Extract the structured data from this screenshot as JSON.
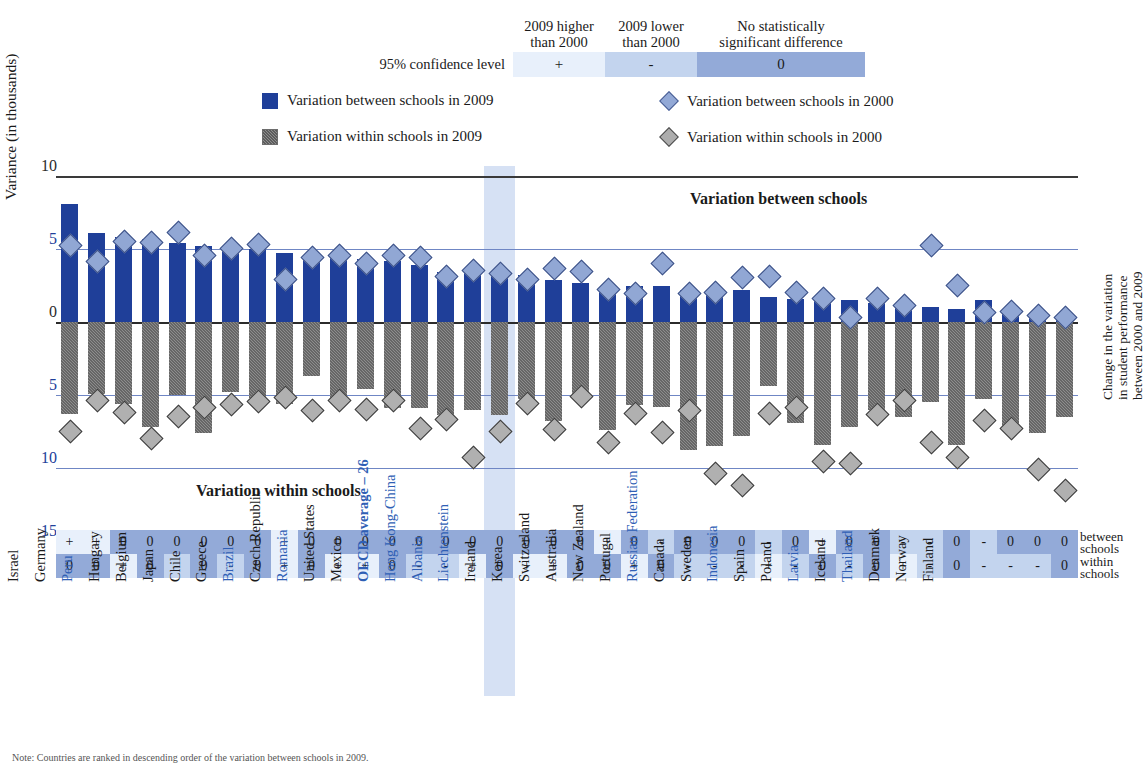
{
  "confidence": {
    "row_label": "95% confidence level",
    "headers": [
      "2009 higher\nthan 2000",
      "2009 lower\nthan 2000",
      "No statistically\nsignificant difference"
    ],
    "header_1_line1": "2009 higher",
    "header_1_line2": "than 2000",
    "header_2_line1": "2009 lower",
    "header_2_line2": "than 2000",
    "header_3_line1": "No statistically",
    "header_3_line2": "significant difference",
    "symbols": [
      "+",
      "-",
      "0"
    ],
    "colors": {
      "higher": "#e8f0fb",
      "lower": "#c3d4ee",
      "nosig": "#93aad8"
    }
  },
  "legend": [
    {
      "marker": "square-blue",
      "label": "Variation between schools in 2009"
    },
    {
      "marker": "diamond-blue",
      "label": "Variation between schools in 2000"
    },
    {
      "marker": "square-grey-hatched",
      "label": "Variation within schools in 2009"
    },
    {
      "marker": "diamond-grey",
      "label": "Variation within schools in 2000"
    }
  ],
  "axis": {
    "y_title": "Variance (in thousands)",
    "y_ticks": [
      "10",
      "5",
      "0",
      "5",
      "10",
      "15"
    ],
    "right_title_line1": "Change in the variation",
    "right_title_line2": "in student performance",
    "right_title_line3": "between 2000 and 2009"
  },
  "plot_labels": {
    "between": "Variation between schools",
    "within": "Variation within schools"
  },
  "sig_side_labels": {
    "between_l1": "between",
    "between_l2": "schools",
    "within_l1": "within",
    "within_l2": "schools"
  },
  "chart_data": {
    "type": "bar",
    "ylabel": "Variance (in thousands)",
    "ylim": [
      -15,
      10
    ],
    "grid": true,
    "zero_line": 0,
    "categories": [
      "Argentina",
      "Italy",
      "Bulgaria",
      "Israel",
      "Germany",
      "Peru",
      "Hungary",
      "Belgium",
      "Japan",
      "Chile",
      "Greece",
      "Brazil",
      "Czech Republic",
      "Romania",
      "United States",
      "Mexico",
      "OECD average – 26",
      "Hong Kong-China",
      "Albania",
      "Liechtenstein",
      "Ireland",
      "Korea",
      "Switzerland",
      "Australia",
      "New Zealand",
      "Portugal",
      "Russian Federation",
      "Canada",
      "Sweden",
      "Indonesia",
      "Spain",
      "Poland",
      "Latvia",
      "Iceland",
      "Thailand",
      "Denmark",
      "Norway",
      "Finland"
    ],
    "highlight_categories": [
      "Argentina",
      "Bulgaria",
      "Peru",
      "Brazil",
      "Romania",
      "OECD average – 26",
      "Hong Kong-China",
      "Albania",
      "Liechtenstein",
      "Russian Federation",
      "Indonesia",
      "Latvia",
      "Thailand"
    ],
    "oecd_index": 16,
    "series": [
      {
        "name": "Variation between schools in 2009",
        "kind": "bar-up",
        "values": [
          8.1,
          6.1,
          5.8,
          5.7,
          5.4,
          5.2,
          5.1,
          5.0,
          4.7,
          4.6,
          4.5,
          4.3,
          4.2,
          3.9,
          3.4,
          3.5,
          3.4,
          3.2,
          2.9,
          2.7,
          2.4,
          2.5,
          2.5,
          2.2,
          2.2,
          2.2,
          1.7,
          1.6,
          1.5,
          1.5,
          1.3,
          1.1,
          1.0,
          0.9,
          1.5,
          0.9,
          0.5,
          0.4
        ]
      },
      {
        "name": "Variation between schools in 2000",
        "kind": "diamond-blue",
        "values": [
          5.3,
          4.2,
          5.6,
          5.5,
          6.2,
          4.6,
          5.1,
          5.4,
          3.0,
          4.5,
          4.6,
          4.1,
          4.6,
          4.5,
          3.2,
          3.6,
          3.4,
          3.0,
          3.7,
          3.5,
          2.3,
          2.0,
          4.1,
          2.0,
          2.1,
          3.1,
          3.2,
          2.1,
          1.7,
          0.4,
          1.7,
          1.2,
          5.3,
          2.6,
          0.7,
          0.8,
          0.5,
          0.4
        ]
      },
      {
        "name": "Variation within schools in 2009",
        "kind": "bar-down",
        "values": [
          -6.3,
          -4.9,
          -5.6,
          -7.2,
          -5.0,
          -7.6,
          -4.8,
          -5.2,
          -5.6,
          -3.7,
          -5.4,
          -4.6,
          -5.9,
          -5.9,
          -6.4,
          -6.0,
          -6.4,
          -5.3,
          -6.8,
          -5.2,
          -7.4,
          -5.7,
          -5.8,
          -8.8,
          -8.5,
          -7.8,
          -4.4,
          -6.9,
          -8.4,
          -7.2,
          -6.0,
          -6.5,
          -5.5,
          -8.4,
          -5.3,
          -7.3,
          -7.6,
          -6.5
        ]
      },
      {
        "name": "Variation within schools in 2000",
        "kind": "diamond-grey",
        "values": [
          -7.4,
          -5.3,
          -6.1,
          -7.9,
          -6.4,
          -5.8,
          -5.6,
          -5.4,
          -5.1,
          -6.0,
          -5.3,
          -5.9,
          -5.3,
          -7.2,
          -6.6,
          -9.2,
          -7.4,
          -5.5,
          -7.3,
          -5.0,
          -8.2,
          -6.2,
          -7.5,
          -6.0,
          -10.3,
          -11.1,
          -6.2,
          -5.8,
          -9.5,
          -9.6,
          -6.3,
          -5.3,
          -8.2,
          -9.2,
          -6.7,
          -7.2,
          -10.0,
          -11.5
        ]
      }
    ],
    "significance": {
      "row_labels": [
        "between schools",
        "within schools"
      ],
      "between": [
        "+",
        "+",
        "0",
        "0",
        "0",
        "0",
        "0",
        "0",
        "+",
        "0",
        "0",
        "0",
        "0",
        "0",
        "0",
        "0",
        "0",
        "0",
        "0",
        "0",
        "+",
        "0",
        "-",
        "0",
        "0",
        "0",
        "-",
        "0",
        "+",
        "0",
        "0",
        "-",
        "-",
        "0",
        "-",
        "0",
        "0",
        "0"
      ],
      "within": [
        "0",
        "0",
        "+",
        "0",
        "-",
        "0",
        "-",
        "0",
        "+",
        "0",
        "+",
        "+",
        "0",
        "-",
        "-",
        "+",
        "0",
        "+",
        "+",
        "0",
        "0",
        "+",
        "0",
        "-",
        "-",
        "-",
        "+",
        "-",
        "0",
        "-",
        "0",
        "+",
        "-",
        "0",
        "-",
        "-",
        "-",
        "0"
      ]
    }
  },
  "footnote": "Note: Countries are ranked in descending order of the variation between schools in 2009."
}
